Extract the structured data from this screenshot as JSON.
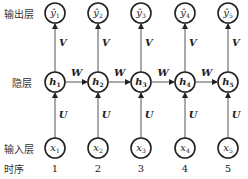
{
  "row_labels": {
    "output": "输出层",
    "hidden": "隐层",
    "input": "输入层",
    "time": "时序"
  },
  "weights": {
    "output": "V",
    "recurrent": "W",
    "input": "U"
  },
  "steps": [
    {
      "t": "1",
      "x": "x",
      "h": "h",
      "y": "ŷ",
      "sub": "1"
    },
    {
      "t": "2",
      "x": "x",
      "h": "h",
      "y": "ŷ",
      "sub": "2"
    },
    {
      "t": "3",
      "x": "x",
      "h": "h",
      "y": "ŷ",
      "sub": "3"
    },
    {
      "t": "4",
      "x": "x",
      "h": "h",
      "y": "ŷ",
      "sub": "4"
    },
    {
      "t": "5",
      "x": "x",
      "h": "h",
      "y": "ŷ",
      "sub": "5"
    }
  ],
  "colors": {
    "stroke": "#222222",
    "line": "#555555",
    "text": "#333333"
  }
}
